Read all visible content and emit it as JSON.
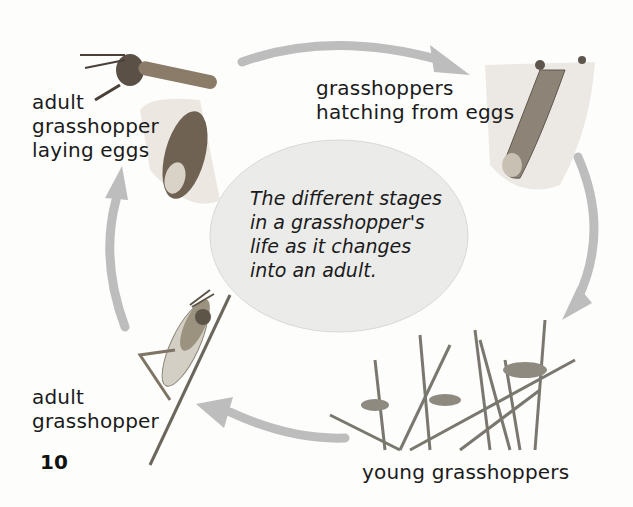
{
  "diagram": {
    "center_caption": {
      "lines": [
        "The different stages",
        "in a grasshopper's",
        "life as it changes",
        "into an adult."
      ]
    },
    "stages": [
      {
        "id": "laying-eggs",
        "lines": [
          "adult",
          "grasshopper",
          "laying eggs"
        ]
      },
      {
        "id": "hatching",
        "lines": [
          "grasshoppers",
          "hatching from eggs"
        ]
      },
      {
        "id": "young",
        "lines": [
          "young grasshoppers"
        ]
      },
      {
        "id": "adult",
        "lines": [
          "adult",
          "grasshopper"
        ]
      }
    ],
    "page_number": "10",
    "colors": {
      "arrow": "#bdbdbd",
      "ellipse_fill": "#ebebea",
      "ellipse_stroke": "#d6d6d4",
      "text": "#1a1a1a"
    },
    "icons": [
      "grasshopper-laying-eggs-illustration",
      "hatching-burrow-illustration",
      "young-grasshoppers-on-grass-illustration",
      "adult-grasshopper-on-stem-illustration"
    ]
  }
}
